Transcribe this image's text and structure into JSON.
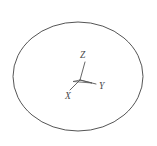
{
  "figure": {
    "background_color": "#ffffff",
    "stroke_color": "#555555",
    "label_color": "#4a4a4a",
    "canvas": {
      "width": 157,
      "height": 146
    },
    "ellipse": {
      "name": "outer-ellipse",
      "center_x": 78,
      "center_y": 76.5,
      "radius_x": 65,
      "radius_y": 54.5,
      "stroke_width": 1,
      "fill": "none"
    },
    "axes": {
      "origin_x": 80,
      "origin_y": 80,
      "stroke_width": 0.9,
      "items": [
        {
          "id": "z",
          "label": "Z",
          "end_x": 85,
          "end_y": 62,
          "label_x": 80,
          "label_y": 58
        },
        {
          "id": "y",
          "label": "Y",
          "end_x": 96,
          "end_y": 84,
          "label_x": 99,
          "label_y": 89
        },
        {
          "id": "x",
          "label": "X",
          "end_x": 70,
          "end_y": 90,
          "label_x": 65,
          "label_y": 99
        }
      ]
    }
  }
}
